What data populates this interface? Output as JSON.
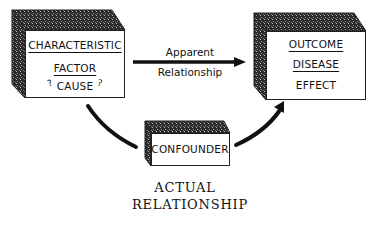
{
  "diagram": {
    "type": "confounding-relationship",
    "nodes": {
      "cause": {
        "lines": [
          "CHARACTERISTIC",
          "FACTOR",
          "CAUSE"
        ],
        "annotation_marks": [
          "?",
          "?"
        ]
      },
      "effect": {
        "lines": [
          "OUTCOME",
          "DISEASE",
          "EFFECT"
        ]
      },
      "confounder": {
        "label": "CONFOUNDER"
      }
    },
    "edges": {
      "apparent": {
        "from": "cause",
        "to": "effect",
        "label_top": "Apparent",
        "label_bottom": "Relationship"
      },
      "confounder_to_cause": {
        "from": "confounder",
        "to": "cause"
      },
      "confounder_to_effect": {
        "from": "confounder",
        "to": "effect"
      }
    },
    "caption": {
      "line1": "ACTUAL",
      "line2": "RELATIONSHIP"
    },
    "colors": {
      "ink": "#111111",
      "shade": "#3a3a3a",
      "background": "#ffffff"
    }
  }
}
